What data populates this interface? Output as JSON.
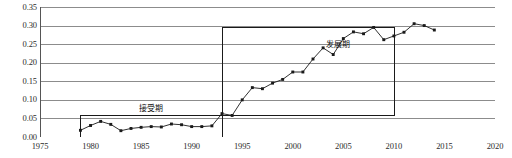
{
  "chart_data": {
    "type": "line",
    "title": "",
    "xlabel": "",
    "ylabel": "",
    "xlim": [
      1975,
      2020
    ],
    "ylim": [
      0.0,
      0.35
    ],
    "grid": true,
    "legend": "none",
    "x_ticks": [
      "1975",
      "1980",
      "1985",
      "1990",
      "1995",
      "2000",
      "2005",
      "2010",
      "2015",
      "2020"
    ],
    "x_tick_values": [
      1975,
      1980,
      1985,
      1990,
      1995,
      2000,
      2005,
      2010,
      2015,
      2020
    ],
    "y_ticks": [
      "0.00",
      "0.05",
      "0.10",
      "0.15",
      "0.20",
      "0.25",
      "0.30",
      "0.35"
    ],
    "y_tick_values": [
      0.0,
      0.05,
      0.1,
      0.15,
      0.2,
      0.25,
      0.3,
      0.35
    ],
    "series": [
      {
        "name": "series-1",
        "marker": "filled-square",
        "color": "#1a1a1a",
        "x": [
          1979,
          1980,
          1981,
          1982,
          1983,
          1984,
          1985,
          1986,
          1987,
          1988,
          1989,
          1990,
          1991,
          1992,
          1993,
          1994,
          1995,
          1996,
          1997,
          1998,
          1999,
          2000,
          2001,
          2002,
          2003,
          2004,
          2005,
          2006,
          2007,
          2008,
          2009,
          2010,
          2011,
          2012,
          2013,
          2014
        ],
        "values": [
          0.018,
          0.031,
          0.042,
          0.034,
          0.017,
          0.023,
          0.026,
          0.028,
          0.027,
          0.035,
          0.033,
          0.028,
          0.028,
          0.03,
          0.063,
          0.058,
          0.1,
          0.133,
          0.13,
          0.145,
          0.155,
          0.175,
          0.175,
          0.21,
          0.24,
          0.222,
          0.265,
          0.283,
          0.278,
          0.295,
          0.262,
          0.272,
          0.282,
          0.305,
          0.3,
          0.288
        ]
      }
    ],
    "annotations": [
      {
        "name": "acceptance-period",
        "label": "接受期",
        "type": "rect",
        "x0": 1979,
        "x1": 1993,
        "y0": 0.0,
        "y1": 0.06,
        "label_x": 1986,
        "label_y": 0.075
      },
      {
        "name": "development-period",
        "label": "发展期",
        "type": "rect",
        "x0": 1993,
        "x1": 2010,
        "y0": 0.06,
        "y1": 0.295,
        "label_x": 2004.5,
        "label_y": 0.248
      }
    ],
    "colors": {
      "gridline": "#8c8c8c",
      "axis": "#555555",
      "line": "#1a1a1a",
      "marker": "#1a1a1a",
      "annotation_box": "#1a1a1a",
      "background": "#ffffff"
    }
  }
}
